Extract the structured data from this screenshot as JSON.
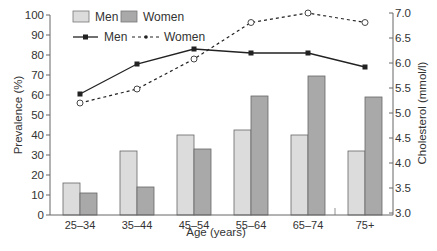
{
  "chart_data": {
    "type": "bar+line",
    "categories": [
      "25–34",
      "35–44",
      "45–54",
      "55–64",
      "65–74",
      "75+"
    ],
    "xlabel": "Age (years)",
    "ylabel": "Prevalence (%)",
    "ylabel_right": "Cholesterol (mmol/l)",
    "ylim": [
      0,
      100
    ],
    "ylim_right": [
      3.0,
      7.0
    ],
    "yticks": [
      0,
      10,
      20,
      30,
      40,
      50,
      60,
      70,
      80,
      90,
      100
    ],
    "yticks_right": [
      "3.0",
      "3.5",
      "4.0",
      "4.5",
      "5.0",
      "5.5",
      "6.0",
      "6.5",
      "7.0"
    ],
    "grid": false,
    "legend_position": "top-left",
    "series": [
      {
        "name": "Men",
        "type": "bar",
        "axis": "left",
        "color": "#dcdcdc",
        "values": [
          16,
          32,
          40,
          42.5,
          40,
          32
        ]
      },
      {
        "name": "Women",
        "type": "bar",
        "axis": "left",
        "color": "#a9a9a9",
        "values": [
          11,
          14,
          33,
          59.5,
          69.5,
          59
        ]
      },
      {
        "name": "Men",
        "type": "line",
        "axis": "right",
        "style": "solid",
        "marker": "filled-square",
        "color": "#222222",
        "values": [
          5.38,
          5.98,
          6.28,
          6.2,
          6.2,
          5.92
        ]
      },
      {
        "name": "Women",
        "type": "line",
        "axis": "right",
        "style": "dashed",
        "marker": "open-circle",
        "color": "#222222",
        "values": [
          5.2,
          5.48,
          6.08,
          6.81,
          7.0,
          6.81
        ]
      }
    ]
  },
  "legend": {
    "bar_men": "Men",
    "bar_women": "Women",
    "line_men": "Men",
    "line_women": "Women"
  }
}
